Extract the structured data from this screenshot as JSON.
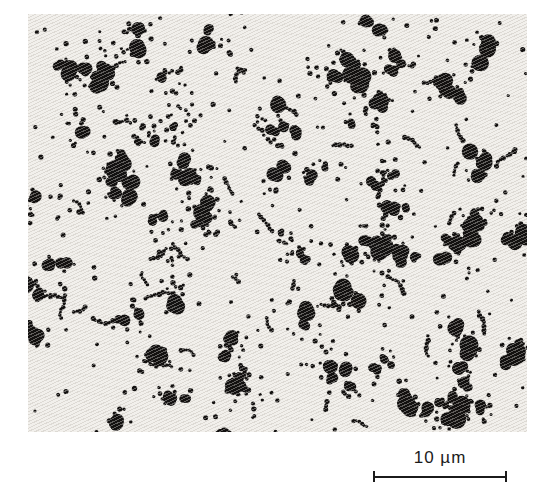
{
  "figure": {
    "kind": "electron-micrograph of particle aggregates",
    "scale_bar": {
      "label": "10 µm"
    },
    "colors": {
      "page_background": "#ffffff",
      "matrix_background": "#f2f0ec",
      "texture_line": "#b2aca3",
      "particle": "#131110",
      "scale_bar": "#1b1b1b"
    },
    "field": {
      "left": 28,
      "top": 14,
      "width": 499,
      "height": 418
    },
    "texture": {
      "angle_deg": 155,
      "period_px": 3
    },
    "particles": {
      "seed": 20240613,
      "clusters": 84,
      "cluster_spread": 17,
      "large_blob_chance": 0.76,
      "large_blobs_max": 3,
      "large_radius_min": 4,
      "large_radius_max": 10,
      "small_per_cluster_min": 3,
      "small_per_cluster_max": 13,
      "small_radius_min": 1.5,
      "small_radius_max": 2.7,
      "chains": 46,
      "chain_len_min": 3,
      "chain_len_max": 9,
      "scatter_dots": 280
    }
  }
}
